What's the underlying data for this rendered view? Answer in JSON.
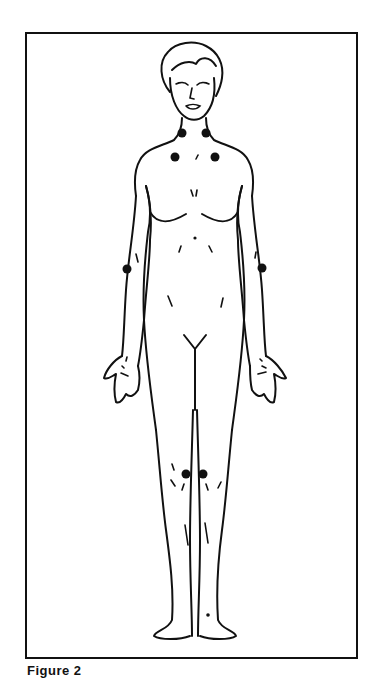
{
  "figure": {
    "caption": "Figure 2",
    "line_color": "#111111",
    "background": "#ffffff",
    "tender_points": [
      {
        "name": "neck-left",
        "x": 182,
        "y": 133
      },
      {
        "name": "neck-right",
        "x": 206,
        "y": 133
      },
      {
        "name": "shoulder-left",
        "x": 175,
        "y": 157
      },
      {
        "name": "shoulder-right",
        "x": 215,
        "y": 157
      },
      {
        "name": "elbow-left",
        "x": 127,
        "y": 269
      },
      {
        "name": "elbow-right",
        "x": 262,
        "y": 268
      },
      {
        "name": "knee-left",
        "x": 186,
        "y": 474
      },
      {
        "name": "knee-right",
        "x": 203,
        "y": 474
      }
    ]
  }
}
